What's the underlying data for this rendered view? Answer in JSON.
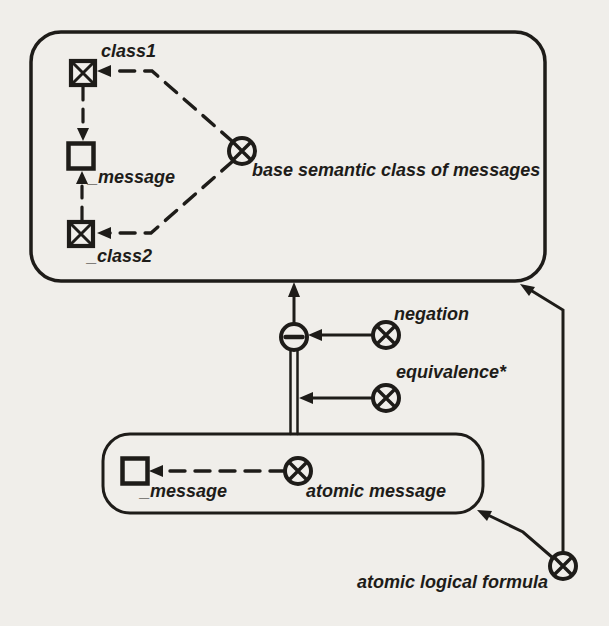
{
  "colors": {
    "ink": "#1e1c19",
    "paper": "#f0eeea"
  },
  "top_box": {
    "class1": {
      "label": "class1",
      "icon": "crossed-square"
    },
    "message": {
      "label": "_message",
      "icon": "open-square"
    },
    "class2": {
      "label": "_class2",
      "icon": "crossed-square"
    },
    "base": {
      "label": "base semantic class of messages",
      "icon": "circle-x"
    }
  },
  "junction": {
    "icon": "circle-minus"
  },
  "negation": {
    "label": "negation",
    "icon": "circle-x"
  },
  "equivalence": {
    "label": "equivalence*",
    "icon": "circle-x"
  },
  "lower_box": {
    "message": {
      "label": "_message",
      "icon": "open-square"
    },
    "atomic_message": {
      "label": "atomic message",
      "icon": "circle-x"
    }
  },
  "formula": {
    "label": "atomic logical formula",
    "icon": "circle-x"
  }
}
